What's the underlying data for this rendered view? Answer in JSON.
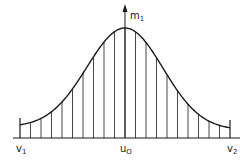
{
  "diagram": {
    "type": "bell-curve-with-ordinates",
    "colors": {
      "ink": "#1a1a1a",
      "background": "#ffffff"
    },
    "axis": {
      "label": {
        "base": "m",
        "sub": "1"
      }
    },
    "labels": {
      "left": {
        "base": "v",
        "sub": "1"
      },
      "center": {
        "base": "u",
        "sub": "O"
      },
      "right": {
        "base": "v",
        "sub": "2"
      }
    },
    "geometry": {
      "baseline_y": 138,
      "baseline_x": [
        13,
        240
      ],
      "peak": [
        125,
        28
      ],
      "left_end": [
        20,
        127
      ],
      "right_end": [
        230,
        130
      ],
      "ordinate_count": 21
    }
  }
}
